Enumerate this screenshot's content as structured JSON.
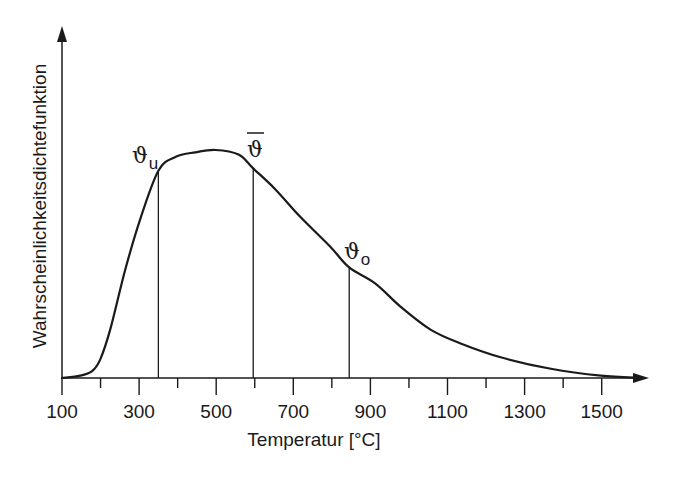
{
  "chart_data": {
    "type": "line",
    "title": "",
    "xlabel": "Temperatur [°C]",
    "ylabel": "Wahrscheinlichkeitsdichtefunktion",
    "xlim": [
      100,
      1620
    ],
    "ylim": [
      0,
      1
    ],
    "grid": false,
    "legend": "none",
    "x_ticks_major": [
      100,
      300,
      500,
      700,
      900,
      1100,
      1300,
      1500
    ],
    "x_ticks_minor": [
      200,
      400,
      600,
      800,
      1000,
      1200,
      1400
    ],
    "x_tick_labels": [
      "100",
      "300",
      "500",
      "700",
      "900",
      "1100",
      "1300",
      "1500"
    ],
    "y_ticks": [],
    "series": [
      {
        "name": "Wahrscheinlichkeitsdichte",
        "x": [
          100,
          147,
          178,
          199,
          225,
          264,
          303,
          350,
          394,
          446,
          498,
          558,
          596,
          653,
          718,
          796,
          845,
          913,
          978,
          1056,
          1134,
          1238,
          1368,
          1498,
          1602
        ],
        "y": [
          0.0,
          0.01,
          0.03,
          0.08,
          0.21,
          0.47,
          0.69,
          0.9,
          0.96,
          0.98,
          0.99,
          0.97,
          0.91,
          0.82,
          0.7,
          0.57,
          0.48,
          0.41,
          0.31,
          0.21,
          0.15,
          0.09,
          0.04,
          0.01,
          0.0
        ]
      }
    ],
    "annotations": [
      {
        "label": "ϑ",
        "subscript": "u",
        "x": 350,
        "y": 0.9,
        "type": "vertical-line"
      },
      {
        "label": "ϑ̄",
        "subscript": "",
        "x": 596,
        "y": 0.91,
        "type": "vertical-line"
      },
      {
        "label": "ϑ",
        "subscript": "o",
        "x": 845,
        "y": 0.48,
        "type": "vertical-line"
      }
    ]
  },
  "labels": {
    "xlabel": "Temperatur [°C]",
    "ylabel": "Wahrscheinlichkeitsdichtefunktion",
    "ticks": [
      "100",
      "300",
      "500",
      "700",
      "900",
      "1100",
      "1300",
      "1500"
    ],
    "marker_u": {
      "symbol": "ϑ",
      "sub": "u"
    },
    "marker_mean": {
      "symbol": "ϑ",
      "overline": true
    },
    "marker_o": {
      "symbol": "ϑ",
      "sub": "o"
    }
  }
}
